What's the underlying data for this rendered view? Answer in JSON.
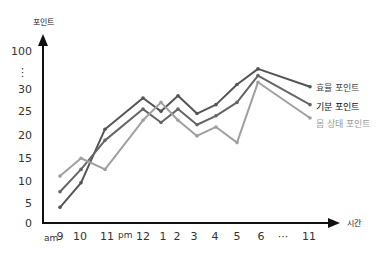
{
  "chart_data": {
    "type": "line",
    "title": "",
    "ylabel": "포인트",
    "xlabel": "시간",
    "y_ticks": [
      "0",
      "5",
      "10",
      "15",
      "20",
      "25",
      "30",
      "⋮",
      "100"
    ],
    "x_prefix_am": "am",
    "x_prefix_pm": "pm",
    "categories": [
      "9",
      "10",
      "11",
      "12",
      "1",
      "2",
      "3",
      "4",
      "5",
      "6",
      "···",
      "11"
    ],
    "x_positions": [
      60,
      81,
      105,
      143,
      161,
      178,
      197,
      216,
      237,
      258,
      null,
      310
    ],
    "grid": false,
    "legend_position": "right, at line ends",
    "series": [
      {
        "name": "효율 포인트",
        "color": "#555555",
        "label_color": "#444444",
        "values": [
          3.5,
          9,
          21,
          28,
          25,
          28.5,
          24.5,
          26.5,
          31,
          34.5,
          null,
          30.5
        ]
      },
      {
        "name": "기분 포인트",
        "color": "#666666",
        "label_color": "#111111",
        "values": [
          7,
          12,
          18.5,
          25.5,
          22.5,
          25.5,
          22,
          24,
          27,
          33,
          null,
          26.5
        ]
      },
      {
        "name": "몸 상태 포인트",
        "color": "#a0a0a0",
        "label_color": "#999999",
        "values": [
          10.5,
          14.5,
          12,
          23,
          27,
          23,
          19.5,
          21.5,
          18,
          31.5,
          null,
          23.5
        ]
      }
    ]
  }
}
